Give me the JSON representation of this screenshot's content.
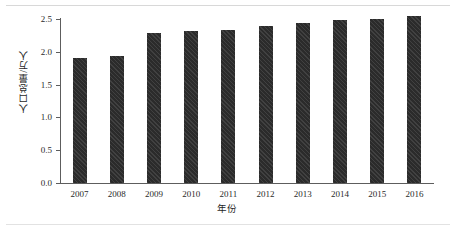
{
  "chart_data": {
    "type": "bar",
    "title": "",
    "xlabel": "年份",
    "ylabel": "人口总量/万人",
    "categories": [
      "2007",
      "2008",
      "2009",
      "2010",
      "2011",
      "2012",
      "2013",
      "2014",
      "2015",
      "2016"
    ],
    "values": [
      1.91,
      1.93,
      2.28,
      2.31,
      2.34,
      2.39,
      2.44,
      2.48,
      2.5,
      2.55
    ],
    "ylim": [
      0.0,
      2.5
    ],
    "ytick_labels": [
      "0.0",
      "0.5",
      "1.0",
      "1.5",
      "2.0",
      "2.5"
    ],
    "ytick_values": [
      0.0,
      0.5,
      1.0,
      1.5,
      2.0,
      2.5
    ],
    "grid": false,
    "legend": "none",
    "series": [
      {
        "name": "人口总量",
        "color": "#2b2b2b",
        "values": [
          1.91,
          1.93,
          2.28,
          2.31,
          2.34,
          2.39,
          2.44,
          2.48,
          2.5,
          2.55
        ]
      }
    ]
  },
  "colors": {
    "bar": "#2b2b2b",
    "axis": "#5d5d5d",
    "text": "#1f1f1f",
    "background": "#ffffff"
  }
}
